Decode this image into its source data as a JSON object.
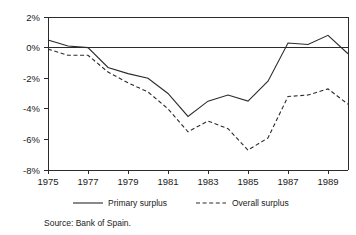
{
  "chart_data": {
    "type": "line",
    "title": "",
    "subtitle": "",
    "xlabel": "",
    "ylabel": "",
    "x": [
      1975,
      1976,
      1977,
      1978,
      1979,
      1980,
      1981,
      1982,
      1983,
      1984,
      1985,
      1986,
      1987,
      1988,
      1989,
      1990
    ],
    "xlim": [
      1975,
      1990
    ],
    "ylim": [
      -8,
      2
    ],
    "grid": false,
    "legend_position": "below-axes",
    "y_tick_labels": [
      "2%",
      "0%",
      "-2%",
      "-4%",
      "-6%",
      "-8%"
    ],
    "y_tick_values": [
      2,
      0,
      -2,
      -4,
      -6,
      -8
    ],
    "x_tick_labels": [
      "1975",
      "1977",
      "1979",
      "1981",
      "1983",
      "1985",
      "1987",
      "1989"
    ],
    "x_tick_values": [
      1975,
      1977,
      1979,
      1981,
      1983,
      1985,
      1987,
      1989
    ],
    "zero_line": 0,
    "series": [
      {
        "name": "Primary surplus",
        "style": "solid",
        "color": "#2b2b2b",
        "values": [
          0.5,
          0.1,
          0.0,
          -1.3,
          -1.7,
          -2.0,
          -3.0,
          -4.5,
          -3.5,
          -3.1,
          -3.5,
          -2.2,
          0.3,
          0.2,
          0.8,
          -0.4
        ]
      },
      {
        "name": "Overall surplus",
        "style": "dashed",
        "color": "#2b2b2b",
        "values": [
          -0.1,
          -0.5,
          -0.5,
          -1.6,
          -2.3,
          -2.9,
          -4.0,
          -5.5,
          -4.8,
          -5.3,
          -6.7,
          -5.9,
          -3.2,
          -3.1,
          -2.7,
          -3.7
        ]
      }
    ]
  },
  "legend": {
    "items": [
      {
        "label": "Primary surplus",
        "style": "solid"
      },
      {
        "label": "Overall surplus",
        "style": "dashed"
      }
    ]
  },
  "source": {
    "text": "Source: Bank of Spain."
  }
}
